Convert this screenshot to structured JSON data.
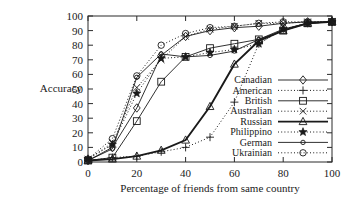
{
  "chart_data": {
    "type": "line",
    "title": "",
    "xlabel": "Percentage of friends from same country",
    "ylabel": "Accuracy",
    "xlim": [
      0,
      100
    ],
    "ylim": [
      0,
      100
    ],
    "xticks": [
      0,
      20,
      40,
      60,
      80,
      100
    ],
    "yticks": [
      0,
      10,
      20,
      30,
      40,
      50,
      60,
      70,
      80,
      90,
      100
    ],
    "xticklabels": [
      "0",
      "20",
      "40",
      "60",
      "80",
      "100"
    ],
    "yticklabels": [
      "0",
      "10",
      "20",
      "30",
      "40",
      "50",
      "60",
      "70",
      "80",
      "90",
      "100"
    ],
    "grid": false,
    "legend_position": "lower-right-inside",
    "x": [
      0,
      10,
      20,
      30,
      40,
      50,
      60,
      70,
      80,
      90,
      100
    ],
    "series": [
      {
        "name": "Canadian",
        "marker": "diamond",
        "linestyle": "solid",
        "values": [
          1,
          10,
          37,
          73,
          86,
          90,
          92,
          93,
          95,
          96,
          96
        ]
      },
      {
        "name": "American",
        "marker": "plus",
        "linestyle": "dotted",
        "values": [
          1,
          3,
          4,
          7,
          10,
          17,
          41,
          81,
          91,
          95,
          96
        ]
      },
      {
        "name": "British",
        "marker": "square",
        "linestyle": "solid",
        "values": [
          1,
          3,
          28,
          55,
          72,
          78,
          81,
          84,
          90,
          95,
          96
        ]
      },
      {
        "name": "Australian",
        "marker": "cross",
        "linestyle": "dotted",
        "values": [
          2,
          13,
          51,
          70,
          86,
          91,
          93,
          95,
          95,
          96,
          96
        ]
      },
      {
        "name": "Russian",
        "marker": "triangle",
        "linestyle": "solid-thick",
        "values": [
          1,
          2,
          4,
          8,
          15,
          38,
          67,
          83,
          90,
          95,
          96
        ]
      },
      {
        "name": "Philippino",
        "marker": "star",
        "linestyle": "dotted",
        "values": [
          2,
          12,
          47,
          71,
          72,
          75,
          77,
          81,
          91,
          95,
          96
        ]
      },
      {
        "name": "German",
        "marker": "circle-small",
        "linestyle": "solid",
        "values": [
          1,
          9,
          58,
          74,
          72,
          73,
          76,
          84,
          91,
          95,
          96
        ]
      },
      {
        "name": "Ukrainian",
        "marker": "circle-open",
        "linestyle": "dotted",
        "values": [
          2,
          16,
          59,
          80,
          88,
          92,
          93,
          95,
          96,
          96,
          96
        ]
      }
    ]
  },
  "legend": {
    "items": [
      {
        "label": "Canadian"
      },
      {
        "label": "American"
      },
      {
        "label": "British"
      },
      {
        "label": "Australian"
      },
      {
        "label": "Russian"
      },
      {
        "label": "Philippino"
      },
      {
        "label": "German"
      },
      {
        "label": "Ukrainian"
      }
    ]
  }
}
